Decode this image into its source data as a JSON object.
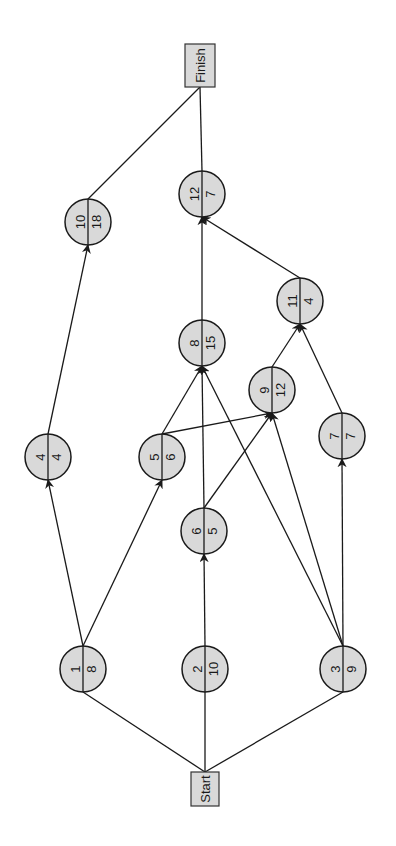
{
  "diagram": {
    "orientation": "rotated-90-ccw",
    "colors": {
      "node_fill": "#d9d9d9",
      "stroke": "#1a1a1a",
      "background": "#ffffff"
    },
    "terminals": [
      {
        "id": "start",
        "label": "Start",
        "x": 191,
        "y": 772,
        "w": 28,
        "h": 34
      },
      {
        "id": "finish",
        "label": "Finish",
        "x": 185,
        "y": 44,
        "w": 30,
        "h": 43
      }
    ],
    "nodes": [
      {
        "id": "1",
        "activity": "1",
        "duration": "8",
        "cx": 83,
        "cy": 669
      },
      {
        "id": "2",
        "activity": "2",
        "duration": "10",
        "cx": 205,
        "cy": 669
      },
      {
        "id": "3",
        "activity": "3",
        "duration": "9",
        "cx": 343,
        "cy": 669
      },
      {
        "id": "4",
        "activity": "4",
        "duration": "4",
        "cx": 48,
        "cy": 457
      },
      {
        "id": "5",
        "activity": "5",
        "duration": "6",
        "cx": 162,
        "cy": 457
      },
      {
        "id": "6",
        "activity": "6",
        "duration": "5",
        "cx": 204,
        "cy": 531
      },
      {
        "id": "7",
        "activity": "7",
        "duration": "7",
        "cx": 342,
        "cy": 436
      },
      {
        "id": "8",
        "activity": "8",
        "duration": "15",
        "cx": 202,
        "cy": 343
      },
      {
        "id": "9",
        "activity": "9",
        "duration": "12",
        "cx": 272,
        "cy": 390
      },
      {
        "id": "10",
        "activity": "10",
        "duration": "18",
        "cx": 88,
        "cy": 222
      },
      {
        "id": "11",
        "activity": "11",
        "duration": "4",
        "cx": 300,
        "cy": 301
      },
      {
        "id": "12",
        "activity": "12",
        "duration": "7",
        "cx": 202,
        "cy": 194
      }
    ],
    "edges": [
      {
        "from": "start",
        "to": "1"
      },
      {
        "from": "start",
        "to": "2"
      },
      {
        "from": "start",
        "to": "3"
      },
      {
        "from": "1",
        "to": "4"
      },
      {
        "from": "1",
        "to": "5"
      },
      {
        "from": "2",
        "to": "6"
      },
      {
        "from": "3",
        "to": "7"
      },
      {
        "from": "3",
        "to": "8"
      },
      {
        "from": "3",
        "to": "9"
      },
      {
        "from": "4",
        "to": "10"
      },
      {
        "from": "5",
        "to": "8"
      },
      {
        "from": "5",
        "to": "9"
      },
      {
        "from": "6",
        "to": "8"
      },
      {
        "from": "6",
        "to": "9"
      },
      {
        "from": "7",
        "to": "11"
      },
      {
        "from": "9",
        "to": "11"
      },
      {
        "from": "8",
        "to": "12"
      },
      {
        "from": "11",
        "to": "12"
      },
      {
        "from": "10",
        "to": "finish"
      },
      {
        "from": "12",
        "to": "finish"
      }
    ],
    "node_radius": 23
  }
}
